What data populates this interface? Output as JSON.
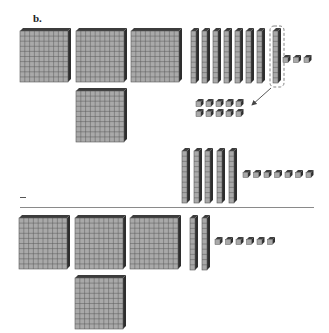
{
  "figure": {
    "label": "b.",
    "operation_symbol": "−",
    "colors": {
      "block_face": "#a9a9a9",
      "block_grid": "#5a5a5a",
      "block_side": "#2e2e2e",
      "block_top": "#3c3c3c",
      "rule_line": "#8a8a8a",
      "arrow": "#444444"
    }
  },
  "minuend": {
    "hundreds": 4,
    "tens": 8,
    "ones": 3,
    "regrouped_ten": "circled rod broken into 10 ones",
    "regrouped_ones": 10
  },
  "subtrahend": {
    "hundreds": 0,
    "tens": 5,
    "ones": 7
  },
  "difference": {
    "hundreds": 4,
    "tens": 2,
    "ones": 6
  }
}
